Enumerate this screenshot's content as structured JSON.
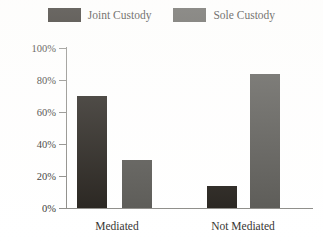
{
  "chart_data": {
    "type": "bar",
    "title": "",
    "subtitle": "",
    "xlabel": "",
    "ylabel": "",
    "categories": [
      "Mediated",
      "Not Mediated"
    ],
    "series": [
      {
        "name": "Joint Custody",
        "color": "#211d18",
        "values": [
          70,
          14
        ]
      },
      {
        "name": "Sole Custody",
        "color": "#565551",
        "values": [
          30,
          84
        ]
      }
    ],
    "ylim": [
      0,
      100
    ],
    "yticks": [
      0,
      20,
      40,
      60,
      80,
      100
    ],
    "ytick_labels": [
      "0%",
      "20%",
      "40%",
      "60%",
      "80%",
      "100%"
    ],
    "value_format": "percent",
    "grid": false,
    "legend_position": "top-center"
  },
  "legend": {
    "entries": [
      {
        "label": "Joint Custody",
        "swatch": "legend-swatch-joint"
      },
      {
        "label": "Sole Custody",
        "swatch": "legend-swatch-sole"
      }
    ]
  },
  "axes": {
    "y_tick_labels": [
      "100%",
      "80%",
      "60%",
      "40%",
      "20%",
      "0%"
    ],
    "x_tick_labels": [
      "Mediated",
      "Not Mediated"
    ]
  },
  "colors": {
    "joint": "#211d18",
    "sole": "#565551",
    "axis": "#8b8a86",
    "text": "#33312e",
    "background": "#ffffff"
  }
}
